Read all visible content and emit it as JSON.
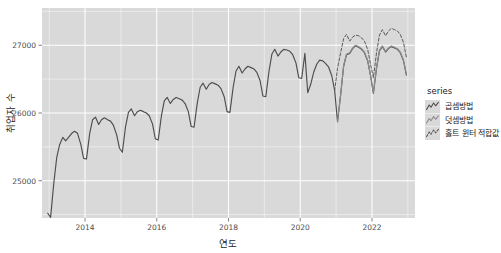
{
  "chart_data": {
    "type": "line",
    "title": "",
    "xlabel": "연도",
    "ylabel": "취업자 수",
    "xlim": [
      2012.8,
      2023.2
    ],
    "ylim": [
      24450,
      27550
    ],
    "xticks": [
      2014,
      2016,
      2018,
      2020,
      2022
    ],
    "xticklabels": [
      "2014",
      "2016",
      "2018",
      "2020",
      "2022"
    ],
    "yticks": [
      25000,
      26000,
      27000
    ],
    "yticklabels": [
      "25000",
      "26000",
      "27000"
    ],
    "grid": true,
    "legend_position": "right",
    "legend_title": "series",
    "series": [
      {
        "name": "곱셈방법",
        "key_glyph": "solid-zigzag",
        "color": "#4d4d4d",
        "dash": "none",
        "x": [
          2012.96,
          2013.04,
          2013.13,
          2013.21,
          2013.29,
          2013.38,
          2013.46,
          2013.54,
          2013.63,
          2013.71,
          2013.79,
          2013.88,
          2013.96,
          2014.04,
          2014.13,
          2014.21,
          2014.29,
          2014.38,
          2014.46,
          2014.54,
          2014.63,
          2014.71,
          2014.79,
          2014.88,
          2014.96,
          2015.04,
          2015.13,
          2015.21,
          2015.29,
          2015.38,
          2015.46,
          2015.54,
          2015.63,
          2015.71,
          2015.79,
          2015.88,
          2015.96,
          2016.04,
          2016.13,
          2016.21,
          2016.29,
          2016.38,
          2016.46,
          2016.54,
          2016.63,
          2016.71,
          2016.79,
          2016.88,
          2016.96,
          2017.04,
          2017.13,
          2017.21,
          2017.29,
          2017.38,
          2017.46,
          2017.54,
          2017.63,
          2017.71,
          2017.79,
          2017.88,
          2017.96,
          2018.04,
          2018.13,
          2018.21,
          2018.29,
          2018.38,
          2018.46,
          2018.54,
          2018.63,
          2018.71,
          2018.79,
          2018.88,
          2018.96,
          2019.04,
          2019.13,
          2019.21,
          2019.29,
          2019.38,
          2019.46,
          2019.54,
          2019.63,
          2019.71,
          2019.79,
          2019.88,
          2019.96,
          2020.04,
          2020.13,
          2020.21,
          2020.29,
          2020.38,
          2020.46,
          2020.54,
          2020.63,
          2020.71,
          2020.79,
          2020.88,
          2020.96,
          2021.04,
          2021.13,
          2021.21,
          2021.29,
          2021.38,
          2021.46,
          2021.54,
          2021.63,
          2021.71,
          2021.79,
          2021.88,
          2021.96,
          2022.04,
          2022.13,
          2022.21,
          2022.29,
          2022.38,
          2022.46,
          2022.54,
          2022.63,
          2022.71,
          2022.79,
          2022.88,
          2022.96
        ],
        "y": [
          24520,
          24460,
          24970,
          25340,
          25530,
          25640,
          25590,
          25640,
          25700,
          25730,
          25700,
          25540,
          25330,
          25320,
          25700,
          25900,
          25940,
          25830,
          25900,
          25930,
          25900,
          25880,
          25820,
          25680,
          25480,
          25420,
          25800,
          26010,
          26060,
          25960,
          26020,
          26040,
          26020,
          26000,
          25960,
          25840,
          25620,
          25600,
          25960,
          26180,
          26230,
          26140,
          26200,
          26230,
          26210,
          26190,
          26140,
          26020,
          25800,
          25790,
          26150,
          26380,
          26440,
          26350,
          26420,
          26450,
          26430,
          26410,
          26360,
          26240,
          26020,
          26010,
          26380,
          26620,
          26690,
          26590,
          26650,
          26690,
          26670,
          26650,
          26600,
          26480,
          26250,
          26240,
          26620,
          26870,
          26940,
          26840,
          26900,
          26940,
          26930,
          26910,
          26860,
          26740,
          26520,
          26510,
          26880,
          26300,
          26420,
          26610,
          26720,
          26780,
          26770,
          26730,
          26680,
          26550,
          26330,
          25870,
          26280,
          26690,
          26860,
          26880,
          26950,
          26990,
          26970,
          26940,
          26890,
          26770,
          26550,
          26290,
          26670,
          26920,
          26980,
          26900,
          26950,
          26980,
          26960,
          26940,
          26890,
          26770,
          26560
        ],
        "annotation": "실제 관측 취업자 수 (월별, 계절 변동 포함)"
      },
      {
        "name": "덧셈방법",
        "key_glyph": "faint-zigzag",
        "color": "#8c8c8c",
        "dash": "none",
        "x": [
          2021.04,
          2021.13,
          2021.21,
          2021.29,
          2021.38,
          2021.46,
          2021.54,
          2021.63,
          2021.71,
          2021.79,
          2021.88,
          2021.96,
          2022.04,
          2022.13,
          2022.21,
          2022.29,
          2022.38,
          2022.46,
          2022.54,
          2022.63,
          2022.71,
          2022.79,
          2022.88,
          2022.96
        ],
        "y": [
          25880,
          26290,
          26700,
          26870,
          26890,
          26960,
          27000,
          26980,
          26950,
          26900,
          26780,
          26560,
          26300,
          26680,
          26930,
          26990,
          26910,
          26960,
          26990,
          26970,
          26950,
          26900,
          26780,
          26570
        ],
        "annotation": "덧셈(가법) 계절 분해 적합값 — 실제값과 거의 겹침"
      },
      {
        "name": "홀트 윈터 적합값",
        "key_glyph": "dashed-zigzag",
        "color": "#595959",
        "dash": "3 2",
        "x": [
          2020.96,
          2021.04,
          2021.13,
          2021.21,
          2021.29,
          2021.38,
          2021.46,
          2021.54,
          2021.63,
          2021.71,
          2021.79,
          2021.88,
          2021.96,
          2022.04,
          2022.13,
          2022.21,
          2022.29,
          2022.38,
          2022.46,
          2022.54,
          2022.63,
          2022.71,
          2022.79,
          2022.88,
          2022.96
        ],
        "y": [
          26330,
          26660,
          26900,
          27100,
          27160,
          27060,
          27120,
          27150,
          27140,
          27110,
          27060,
          26940,
          26720,
          26520,
          26900,
          27150,
          27230,
          27140,
          27210,
          27250,
          27230,
          27210,
          27160,
          27040,
          26820
        ],
        "annotation": "홀트-윈터 지수평활 예측/적합 — 2021년 이후 실제값 상회"
      }
    ],
    "notes": [
      "2020년 초 코로나19로 인한 급격한 취업자 수 감소 확인",
      "매년 1~2월 계절적 최저점, 여름~가을 최고점 반복",
      "2013년 약 24,500천명에서 2022년 약 27,000천명까지 장기 상승 추세"
    ]
  },
  "legend": {
    "title": "series",
    "items": [
      {
        "label": "곱셈방법"
      },
      {
        "label": "덧셈방법"
      },
      {
        "label": "홀트 윈터 적합값"
      }
    ]
  },
  "axes": {
    "x_title": "연도",
    "y_title": "취업자 수",
    "x_tick_labels": [
      "2014",
      "2016",
      "2018",
      "2020",
      "2022"
    ],
    "y_tick_labels": [
      "25000",
      "26000",
      "27000"
    ]
  },
  "colors": {
    "panel_background": "#d9d9d9",
    "grid": "#ffffff",
    "series_multiplicative": "#4d4d4d",
    "series_additive": "#8c8c8c",
    "series_holtwinters": "#595959",
    "page_background": "#ffffff",
    "text": "#1a1a1a"
  }
}
